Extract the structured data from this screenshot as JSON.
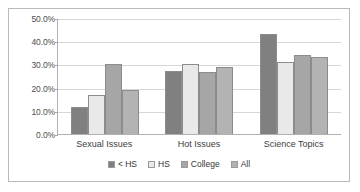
{
  "chart_data": {
    "type": "bar",
    "title": "",
    "subtitle": "",
    "xlabel": "",
    "ylabel": "",
    "categories": [
      "Sexual Issues",
      "Hot Issues",
      "Science Topics"
    ],
    "series": [
      {
        "name": "< HS",
        "values": [
          11.5,
          27.2,
          43.0
        ],
        "color": "#808080"
      },
      {
        "name": "HS",
        "values": [
          16.8,
          30.3,
          31.2
        ],
        "color": "#e9e9e9"
      },
      {
        "name": "College",
        "values": [
          30.3,
          26.8,
          34.2
        ],
        "color": "#a6a6a6"
      },
      {
        "name": "All",
        "values": [
          19.0,
          29.1,
          33.3
        ],
        "color": "#b3b3b3"
      }
    ],
    "ylim": [
      0,
      50
    ],
    "ytick_values": [
      0,
      10,
      20,
      30,
      40,
      50
    ],
    "ytick_labels": [
      "0.0%",
      "10.0%",
      "20.0%",
      "30.0%",
      "40.0%",
      "50.0%"
    ],
    "grid": true,
    "legend_position": "bottom",
    "legend_entries": [
      "< HS",
      "HS",
      "College",
      "All"
    ]
  },
  "colors": {
    "frame_border": "#b9b9b9",
    "gridline": "#d6d6d6",
    "axis": "#b0b0b0",
    "label_text": "#4d4d4d",
    "background": "#ffffff"
  }
}
